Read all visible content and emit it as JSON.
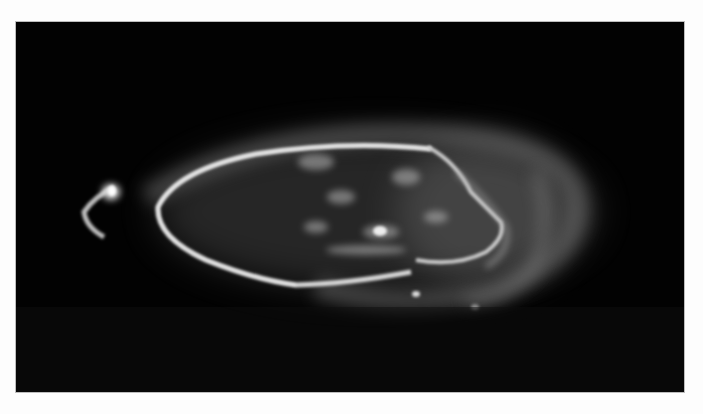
{
  "image": {
    "subject": "ultraviolet auroral oval",
    "alt": "Grayscale image of a bright auroral oval with diffuse emission and a bright spot on the left, on black background",
    "colors": {
      "background": "#fdfdfd",
      "sky": "#020202",
      "glow": "#e8e8e8"
    }
  }
}
